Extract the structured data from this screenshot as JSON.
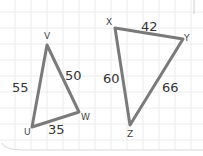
{
  "diagram": {
    "type": "two-triangles-on-grid",
    "triangle_uvw": {
      "vertices": {
        "U": {
          "label": "U",
          "x": 32,
          "y": 127
        },
        "V": {
          "label": "V",
          "x": 47,
          "y": 45
        },
        "W": {
          "label": "W",
          "x": 79,
          "y": 112
        }
      },
      "sides": {
        "UV": {
          "label": "55",
          "x": 12,
          "y": 92
        },
        "VW": {
          "label": "50",
          "x": 65,
          "y": 80
        },
        "UW": {
          "label": "35",
          "x": 48,
          "y": 134
        }
      }
    },
    "triangle_xyz": {
      "vertices": {
        "X": {
          "label": "X",
          "x": 115,
          "y": 28
        },
        "Y": {
          "label": "Y",
          "x": 183,
          "y": 39
        },
        "Z": {
          "label": "Z",
          "x": 130,
          "y": 125
        }
      },
      "sides": {
        "XY": {
          "label": "42",
          "x": 141,
          "y": 31
        },
        "XZ": {
          "label": "60",
          "x": 103,
          "y": 83
        },
        "YZ": {
          "label": "66",
          "x": 162,
          "y": 92
        }
      }
    },
    "colors": {
      "stroke": "#7a7a7a",
      "grid": "#ececec",
      "background": "#ffffff"
    }
  }
}
